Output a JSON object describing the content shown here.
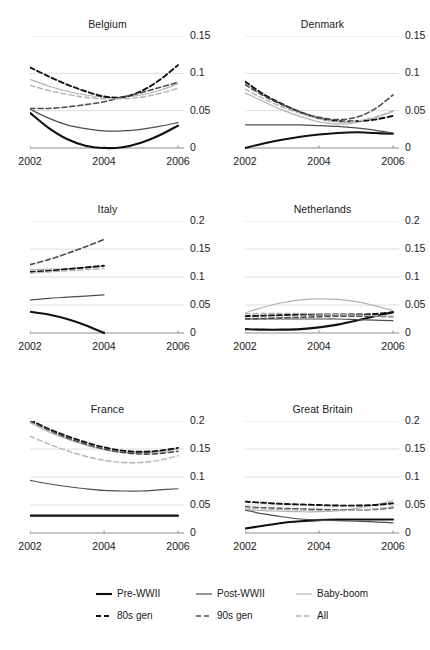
{
  "figure": {
    "width": 430,
    "height": 650,
    "background": "#ffffff",
    "grid_color": "#d9d9d9",
    "axis_color": "#8c8c8c"
  },
  "series_styles": [
    {
      "key": "pre_wwii",
      "label": "Pre-WWII",
      "color": "#111111",
      "width": 2.1,
      "dash": "none"
    },
    {
      "key": "post_wwii",
      "label": "Post-WWII",
      "color": "#4d4d4d",
      "width": 1.2,
      "dash": "none"
    },
    {
      "key": "baby_boom",
      "label": "Baby-boom",
      "color": "#b3b3b3",
      "width": 1.2,
      "dash": "none"
    },
    {
      "key": "gen80s",
      "label": "80s gen",
      "color": "#111111",
      "width": 1.9,
      "dash": "5,3"
    },
    {
      "key": "gen90s",
      "label": "90s gen",
      "color": "#4d4d4d",
      "width": 1.6,
      "dash": "5,3"
    },
    {
      "key": "all",
      "label": "All",
      "color": "#b3b3b3",
      "width": 1.4,
      "dash": "5,3"
    }
  ],
  "legend": {
    "rows": [
      [
        "Pre-WWII",
        "Post-WWII",
        "Baby-boom"
      ],
      [
        "80s gen",
        "90s gen",
        "All"
      ]
    ]
  },
  "chart_data": {
    "type": "line",
    "title": "",
    "xlabel": "",
    "ylabel": "",
    "grid": true,
    "legend_position": "bottom",
    "x": [
      2002,
      2002.5,
      2003,
      2003.5,
      2004,
      2004.5,
      2005,
      2005.5,
      2006
    ],
    "xticks": [
      2002,
      2004,
      2006
    ],
    "xlim": [
      2002,
      2006
    ],
    "panels": [
      {
        "title": "Belgium",
        "ylim": [
          0,
          0.15
        ],
        "yticks": [
          0,
          0.05,
          0.1,
          0.15
        ],
        "ytick_labels": [
          "0",
          "0.05",
          "0.1",
          "0.15"
        ],
        "series": [
          {
            "name": "Pre-WWII",
            "key": "pre_wwii",
            "values": [
              0.047,
              0.027,
              0.012,
              0.003,
              0.0,
              0.001,
              0.007,
              0.017,
              0.03
            ]
          },
          {
            "name": "Post-WWII",
            "key": "post_wwii",
            "values": [
              0.052,
              0.04,
              0.031,
              0.026,
              0.023,
              0.023,
              0.025,
              0.029,
              0.034
            ]
          },
          {
            "name": "Baby-boom",
            "key": "baby_boom",
            "values": [
              0.092,
              0.083,
              0.076,
              0.071,
              0.068,
              0.068,
              0.071,
              0.077,
              0.086
            ]
          },
          {
            "name": "80s gen",
            "key": "gen80s",
            "values": [
              0.108,
              0.096,
              0.085,
              0.076,
              0.069,
              0.068,
              0.076,
              0.091,
              0.111
            ]
          },
          {
            "name": "90s gen",
            "key": "gen90s",
            "values": [
              0.053,
              0.053,
              0.055,
              0.058,
              0.062,
              0.068,
              0.074,
              0.081,
              0.088
            ]
          },
          {
            "name": "All",
            "key": "all",
            "values": [
              0.084,
              0.077,
              0.072,
              0.068,
              0.066,
              0.066,
              0.068,
              0.073,
              0.08
            ]
          }
        ]
      },
      {
        "title": "Denmark",
        "ylim": [
          0,
          0.15
        ],
        "yticks": [
          0,
          0.05,
          0.1,
          0.15
        ],
        "ytick_labels": [
          "0",
          "0.05",
          "0.1",
          "0.15"
        ],
        "series": [
          {
            "name": "Pre-WWII",
            "key": "pre_wwii",
            "values": [
              0.0,
              0.006,
              0.011,
              0.015,
              0.018,
              0.02,
              0.021,
              0.02,
              0.019
            ]
          },
          {
            "name": "Post-WWII",
            "key": "post_wwii",
            "values": [
              0.031,
              0.031,
              0.031,
              0.031,
              0.03,
              0.029,
              0.027,
              0.024,
              0.02
            ]
          },
          {
            "name": "Baby-boom",
            "key": "baby_boom",
            "values": [
              0.074,
              0.062,
              0.051,
              0.042,
              0.035,
              0.032,
              0.034,
              0.04,
              0.049
            ]
          },
          {
            "name": "80s gen",
            "key": "gen80s",
            "values": [
              0.089,
              0.072,
              0.059,
              0.048,
              0.04,
              0.036,
              0.036,
              0.038,
              0.043
            ]
          },
          {
            "name": "90s gen",
            "key": "gen90s",
            "values": [
              0.085,
              0.07,
              0.058,
              0.048,
              0.041,
              0.038,
              0.041,
              0.052,
              0.071
            ]
          },
          {
            "name": "All",
            "key": "all",
            "values": [
              0.079,
              0.066,
              0.055,
              0.046,
              0.039,
              0.035,
              0.036,
              0.041,
              0.05
            ]
          }
        ]
      },
      {
        "title": "Italy",
        "ylim": [
          0,
          0.2
        ],
        "yticks": [
          0,
          0.05,
          0.1,
          0.15,
          0.2
        ],
        "ytick_labels": [
          "0",
          "0.05",
          "0.1",
          "0.15",
          "0.2"
        ],
        "x_end": 2004,
        "series": [
          {
            "name": "Pre-WWII",
            "key": "pre_wwii",
            "values": [
              0.038,
              0.033,
              0.025,
              0.014,
              0.0
            ]
          },
          {
            "name": "Post-WWII",
            "key": "post_wwii",
            "values": [
              0.059,
              0.062,
              0.064,
              0.066,
              0.068
            ]
          },
          {
            "name": "Baby-boom",
            "key": "baby_boom",
            "values": [
              0.113,
              0.114,
              0.115,
              0.117,
              0.119
            ]
          },
          {
            "name": "80s gen",
            "key": "gen80s",
            "values": [
              0.109,
              0.111,
              0.114,
              0.117,
              0.12
            ]
          },
          {
            "name": "90s gen",
            "key": "gen90s",
            "values": [
              0.122,
              0.131,
              0.142,
              0.154,
              0.167
            ]
          },
          {
            "name": "All",
            "key": "all",
            "values": [
              0.107,
              0.109,
              0.111,
              0.113,
              0.115
            ]
          }
        ]
      },
      {
        "title": "Netherlands",
        "ylim": [
          0,
          0.2
        ],
        "yticks": [
          0,
          0.05,
          0.1,
          0.15,
          0.2
        ],
        "ytick_labels": [
          "0",
          "0.05",
          "0.1",
          "0.15",
          "0.2"
        ],
        "series": [
          {
            "name": "Pre-WWII",
            "key": "pre_wwii",
            "values": [
              0.007,
              0.006,
              0.006,
              0.007,
              0.01,
              0.015,
              0.022,
              0.03,
              0.037
            ]
          },
          {
            "name": "Post-WWII",
            "key": "post_wwii",
            "values": [
              0.025,
              0.025,
              0.025,
              0.025,
              0.025,
              0.025,
              0.024,
              0.023,
              0.022
            ]
          },
          {
            "name": "Baby-boom",
            "key": "baby_boom",
            "values": [
              0.036,
              0.046,
              0.054,
              0.059,
              0.061,
              0.06,
              0.056,
              0.049,
              0.04
            ]
          },
          {
            "name": "80s gen",
            "key": "gen80s",
            "values": [
              0.03,
              0.031,
              0.032,
              0.033,
              0.033,
              0.033,
              0.033,
              0.034,
              0.037
            ]
          },
          {
            "name": "90s gen",
            "key": "gen90s",
            "values": [
              0.025,
              0.026,
              0.027,
              0.028,
              0.029,
              0.03,
              0.03,
              0.03,
              0.029
            ]
          },
          {
            "name": "All",
            "key": "all",
            "values": [
              0.034,
              0.035,
              0.035,
              0.035,
              0.034,
              0.033,
              0.032,
              0.031,
              0.03
            ]
          }
        ]
      },
      {
        "title": "France",
        "ylim": [
          0,
          0.2
        ],
        "yticks": [
          0,
          0.05,
          0.1,
          0.15,
          0.2
        ],
        "ytick_labels": [
          "0",
          "0.05",
          "0.1",
          "0.15",
          "0.2"
        ],
        "series": [
          {
            "name": "Pre-WWII",
            "key": "pre_wwii",
            "values": [
              0.031,
              0.031,
              0.031,
              0.031,
              0.031,
              0.031,
              0.031,
              0.031,
              0.031
            ]
          },
          {
            "name": "Post-WWII",
            "key": "post_wwii",
            "values": [
              0.094,
              0.088,
              0.083,
              0.079,
              0.076,
              0.075,
              0.075,
              0.077,
              0.079
            ]
          },
          {
            "name": "Baby-boom",
            "key": "baby_boom",
            "values": [
              0.197,
              0.181,
              0.168,
              0.157,
              0.149,
              0.144,
              0.143,
              0.145,
              0.15
            ]
          },
          {
            "name": "80s gen",
            "key": "gen80s",
            "values": [
              0.202,
              0.186,
              0.173,
              0.162,
              0.153,
              0.147,
              0.145,
              0.147,
              0.152
            ]
          },
          {
            "name": "90s gen",
            "key": "gen90s",
            "values": [
              0.2,
              0.184,
              0.17,
              0.159,
              0.15,
              0.144,
              0.141,
              0.142,
              0.146
            ]
          },
          {
            "name": "All",
            "key": "all",
            "values": [
              0.173,
              0.159,
              0.147,
              0.137,
              0.13,
              0.126,
              0.126,
              0.13,
              0.138
            ]
          }
        ]
      },
      {
        "title": "Great Britain",
        "ylim": [
          0,
          0.2
        ],
        "yticks": [
          0,
          0.05,
          0.1,
          0.15,
          0.2
        ],
        "ytick_labels": [
          "0",
          "0.05",
          "0.1",
          "0.15",
          "0.2"
        ],
        "series": [
          {
            "name": "Pre-WWII",
            "key": "pre_wwii",
            "values": [
              0.008,
              0.013,
              0.018,
              0.021,
              0.023,
              0.024,
              0.024,
              0.024,
              0.024
            ]
          },
          {
            "name": "Post-WWII",
            "key": "post_wwii",
            "values": [
              0.041,
              0.034,
              0.029,
              0.025,
              0.023,
              0.022,
              0.021,
              0.02,
              0.018
            ]
          },
          {
            "name": "Baby-boom",
            "key": "baby_boom",
            "values": [
              0.042,
              0.04,
              0.039,
              0.038,
              0.038,
              0.04,
              0.044,
              0.05,
              0.058
            ]
          },
          {
            "name": "80s gen",
            "key": "gen80s",
            "values": [
              0.056,
              0.054,
              0.052,
              0.051,
              0.05,
              0.049,
              0.049,
              0.05,
              0.053
            ]
          },
          {
            "name": "90s gen",
            "key": "gen90s",
            "values": [
              0.047,
              0.045,
              0.044,
              0.043,
              0.042,
              0.041,
              0.041,
              0.042,
              0.045
            ]
          },
          {
            "name": "All",
            "key": "all",
            "values": [
              0.045,
              0.043,
              0.042,
              0.041,
              0.04,
              0.04,
              0.041,
              0.043,
              0.047
            ]
          }
        ]
      }
    ]
  }
}
